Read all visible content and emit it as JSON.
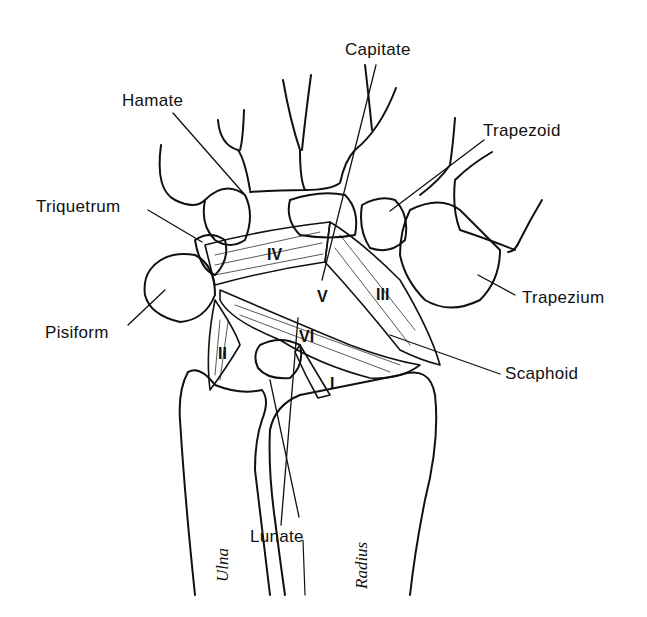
{
  "diagram": {
    "bone_labels": {
      "capitate": "Capitate",
      "hamate": "Hamate",
      "trapezoid": "Trapezoid",
      "triquetrum": "Triquetrum",
      "trapezium": "Trapezium",
      "pisiform": "Pisiform",
      "scaphoid": "Scaphoid",
      "lunate": "Lunate",
      "ulna": "Ulna",
      "radius": "Radius"
    },
    "ligament_labels": {
      "i": "I",
      "ii": "II",
      "iii": "III",
      "iv": "IV",
      "v": "V",
      "vi": "VI"
    },
    "colors": {
      "line": "#111111",
      "background": "#ffffff"
    }
  }
}
